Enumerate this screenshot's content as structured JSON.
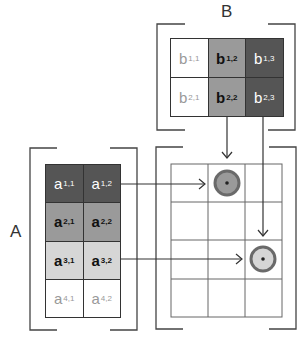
{
  "labels": {
    "A": "A",
    "B": "B"
  },
  "colors": {
    "dark": "#555555",
    "mid": "#9a9a9a",
    "light": "#d6d6d6",
    "white": "#ffffff",
    "line": "#444444",
    "ring": "#6a6a6a"
  },
  "matrix_B": {
    "rows": [
      [
        {
          "base": "b",
          "sub": "1,1",
          "shade": "white"
        },
        {
          "base": "b",
          "sub": "1,2",
          "shade": "mid"
        },
        {
          "base": "b",
          "sub": "1,3",
          "shade": "dark"
        }
      ],
      [
        {
          "base": "b",
          "sub": "2,1",
          "shade": "white"
        },
        {
          "base": "b",
          "sub": "2,2",
          "shade": "mid"
        },
        {
          "base": "b",
          "sub": "2,3",
          "shade": "dark"
        }
      ]
    ]
  },
  "matrix_A": {
    "rows": [
      [
        {
          "base": "a",
          "sub": "1,1",
          "shade": "dark"
        },
        {
          "base": "a",
          "sub": "1,2",
          "shade": "dark"
        }
      ],
      [
        {
          "base": "a",
          "sub": "2,1",
          "shade": "mid"
        },
        {
          "base": "a",
          "sub": "2,2",
          "shade": "mid"
        }
      ],
      [
        {
          "base": "a",
          "sub": "3,1",
          "shade": "light"
        },
        {
          "base": "a",
          "sub": "3,2",
          "shade": "light"
        }
      ],
      [
        {
          "base": "a",
          "sub": "4,1",
          "shade": "white"
        },
        {
          "base": "a",
          "sub": "4,2",
          "shade": "white"
        }
      ]
    ]
  },
  "matrix_C": {
    "rows": 4,
    "cols": 3,
    "highlights": [
      {
        "row": 1,
        "col": 2,
        "fill": "#9a9a9a"
      },
      {
        "row": 3,
        "col": 3,
        "fill": "#d6d6d6"
      }
    ]
  }
}
